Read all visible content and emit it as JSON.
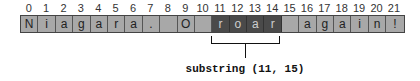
{
  "diagram": {
    "indices": [
      "0",
      "1",
      "2",
      "3",
      "4",
      "5",
      "6",
      "7",
      "8",
      "9",
      "10",
      "11",
      "12",
      "13",
      "14",
      "15",
      "16",
      "17",
      "18",
      "19",
      "20",
      "21"
    ],
    "cells": [
      "N",
      "i",
      "a",
      "g",
      "a",
      "r",
      "a",
      ".",
      "",
      "O",
      "",
      "r",
      "o",
      "a",
      "r",
      "",
      "a",
      "g",
      "a",
      "i",
      "n",
      "!"
    ],
    "highlight_range": [
      11,
      15
    ],
    "label": "substring (11, 15)",
    "colors": {
      "cell": "#a8a8a8",
      "highlight": "#4a4a4a",
      "highlight_text": "#cfcfcf",
      "border": "#444444"
    }
  }
}
